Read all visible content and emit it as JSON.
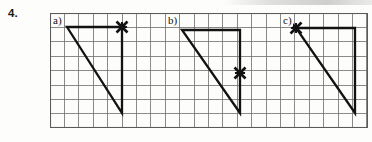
{
  "exercise": {
    "number": "4."
  },
  "grid": {
    "left": 50,
    "top": 13,
    "width": 318,
    "height": 115,
    "cell_size": 14.4,
    "cols": 22,
    "rows": 8,
    "line_color": "#6d6d6d",
    "border_color": "#5a5a5a",
    "background": "#fdfdfb"
  },
  "figures": [
    {
      "label": "a)",
      "label_x": 52,
      "label_y": 15,
      "shape": "right-triangle",
      "stroke_color": "#121212",
      "stroke_width": 2.3,
      "vertices": [
        {
          "name": "top-left",
          "x": 67,
          "y": 27
        },
        {
          "name": "top-right",
          "x": 122,
          "y": 27
        },
        {
          "name": "bottom-right",
          "x": 122,
          "y": 113
        }
      ],
      "mark": {
        "glyph": "x-mark",
        "x": 122,
        "y": 27,
        "at_vertex": "top-right",
        "size": 11
      }
    },
    {
      "label": "b)",
      "label_x": 167,
      "label_y": 15,
      "shape": "right-triangle",
      "stroke_color": "#121212",
      "stroke_width": 2.3,
      "vertices": [
        {
          "name": "top-left",
          "x": 182,
          "y": 30
        },
        {
          "name": "top-right",
          "x": 240,
          "y": 30
        },
        {
          "name": "bottom-right",
          "x": 240,
          "y": 113
        }
      ],
      "mark": {
        "glyph": "x-mark",
        "x": 240,
        "y": 73,
        "at_vertex": "right-edge-midpoint",
        "size": 11
      }
    },
    {
      "label": "c)",
      "label_x": 282,
      "label_y": 15,
      "shape": "right-triangle",
      "stroke_color": "#121212",
      "stroke_width": 2.3,
      "vertices": [
        {
          "name": "top-left",
          "x": 296,
          "y": 28
        },
        {
          "name": "top-right",
          "x": 355,
          "y": 28
        },
        {
          "name": "bottom-right",
          "x": 355,
          "y": 113
        }
      ],
      "mark": {
        "glyph": "x-mark",
        "x": 296,
        "y": 28,
        "at_vertex": "top-left",
        "size": 11
      }
    }
  ]
}
